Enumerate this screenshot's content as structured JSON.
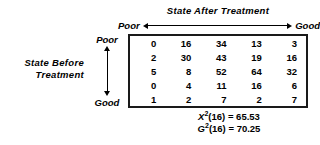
{
  "figure": {
    "column_heading": "State After Treatment",
    "column_scale": {
      "low_label": "Poor",
      "high_label": "Good",
      "arrow": "double-headed-horizontal-arrow"
    },
    "row_heading_line1": "State Before",
    "row_heading_line2": "Treatment",
    "row_scale": {
      "top_label": "Poor",
      "bottom_label": "Good",
      "arrow": "double-headed-vertical-arrow"
    }
  },
  "chart_data": {
    "type": "table",
    "title": "State After Treatment",
    "xlabel": "State After Treatment",
    "ylabel": "State Before Treatment",
    "x_scale_endpoints": [
      "Poor",
      "Good"
    ],
    "y_scale_endpoints": [
      "Poor",
      "Good"
    ],
    "grid": false,
    "legend": "none",
    "categories": [
      "Poor",
      "2",
      "3",
      "4",
      "Good"
    ],
    "rows": [
      [
        "0",
        "16",
        "34",
        "13",
        "3"
      ],
      [
        "2",
        "30",
        "43",
        "19",
        "16"
      ],
      [
        "5",
        "8",
        "52",
        "64",
        "32"
      ],
      [
        "0",
        "4",
        "11",
        "16",
        "6"
      ],
      [
        "1",
        "2",
        "7",
        "2",
        "7"
      ]
    ],
    "annotations": [
      "X²(16) = 65.53",
      "G²(16) = 70.25"
    ]
  },
  "statistics": {
    "chi_square": {
      "symbol": "X",
      "exponent": "2",
      "df": "(16)",
      "equals": "=",
      "value": "65.53"
    },
    "likelihood_ratio": {
      "symbol": "G",
      "exponent": "2",
      "df": "(16)",
      "equals": "=",
      "value": "70.25"
    }
  },
  "colors": {
    "background": "#ffffff",
    "text": "#000000",
    "table_border": "#1a1a1a"
  }
}
